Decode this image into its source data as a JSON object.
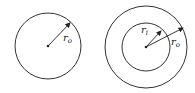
{
  "diagram": {
    "figures": [
      {
        "name": "solid-circle",
        "center": [
          48,
          46
        ],
        "outer_radius_px": 33,
        "labels": [
          {
            "text": "r",
            "subscript": "o"
          }
        ]
      },
      {
        "name": "annulus",
        "center": [
          146,
          47
        ],
        "outer_radius_px": 41,
        "inner_radius_px": 24,
        "labels": [
          {
            "text": "r",
            "subscript": "i"
          },
          {
            "text": "r",
            "subscript": "o"
          }
        ]
      }
    ],
    "stroke_color": "#333333"
  }
}
